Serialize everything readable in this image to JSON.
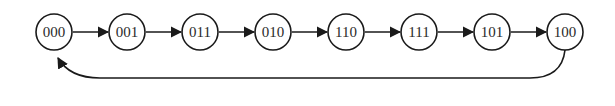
{
  "diagram": {
    "type": "state-sequence",
    "nodes": [
      {
        "id": "n0",
        "label": "000"
      },
      {
        "id": "n1",
        "label": "001"
      },
      {
        "id": "n2",
        "label": "011"
      },
      {
        "id": "n3",
        "label": "010"
      },
      {
        "id": "n4",
        "label": "110"
      },
      {
        "id": "n5",
        "label": "111"
      },
      {
        "id": "n6",
        "label": "101"
      },
      {
        "id": "n7",
        "label": "100"
      }
    ],
    "edges": [
      {
        "from": "000",
        "to": "001"
      },
      {
        "from": "001",
        "to": "011"
      },
      {
        "from": "011",
        "to": "010"
      },
      {
        "from": "010",
        "to": "110"
      },
      {
        "from": "110",
        "to": "111"
      },
      {
        "from": "111",
        "to": "101"
      },
      {
        "from": "101",
        "to": "100"
      },
      {
        "from": "100",
        "to": "000",
        "style": "return-loop"
      }
    ],
    "colors": {
      "stroke": "#1a1a1a",
      "text": "#2a2a2a",
      "background": "#ffffff"
    }
  }
}
